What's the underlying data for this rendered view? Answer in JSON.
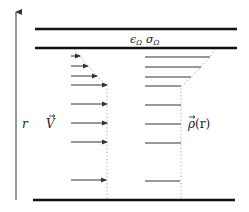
{
  "diagram": {
    "labels": {
      "layer": "ϵΩ σΩ",
      "layer_eps": "ϵ",
      "layer_sigma": "σ",
      "layer_sub": "Ω",
      "axis": "r",
      "velocity": "V",
      "density": "ρ(r)",
      "density_symbol": "ρ",
      "density_arg": "(r)"
    },
    "colors": {
      "plate": "#111111",
      "arrow": "#333333",
      "dotted": "#888888",
      "text": "#222222"
    },
    "axis": {
      "x": 16,
      "y_bottom": 200,
      "y_top": 10
    },
    "plates": [
      {
        "name": "top-outer",
        "y": 29,
        "x1": 35,
        "x2": 237
      },
      {
        "name": "top-inner",
        "y": 48,
        "x1": 35,
        "x2": 237
      },
      {
        "name": "bottom",
        "y": 200,
        "x1": 33,
        "x2": 235
      }
    ],
    "velocity_arrows": {
      "x_start": 71,
      "rows": [
        {
          "y": 56,
          "x_end": 80
        },
        {
          "y": 66,
          "x_end": 88
        },
        {
          "y": 76,
          "x_end": 97
        },
        {
          "y": 85,
          "x_end": 107
        },
        {
          "y": 104,
          "x_end": 107
        },
        {
          "y": 123,
          "x_end": 107
        },
        {
          "y": 142,
          "x_end": 107
        },
        {
          "y": 180,
          "x_end": 106
        }
      ]
    },
    "density_lines": {
      "x_start": 145,
      "rows": [
        {
          "y": 57,
          "x_end": 210
        },
        {
          "y": 67,
          "x_end": 201
        },
        {
          "y": 77,
          "x_end": 191
        },
        {
          "y": 86,
          "x_end": 181
        },
        {
          "y": 105,
          "x_end": 181
        },
        {
          "y": 124,
          "x_end": 181
        },
        {
          "y": 143,
          "x_end": 181
        },
        {
          "y": 181,
          "x_end": 180
        }
      ]
    },
    "velocity_profile_points": [
      [
        74,
        49
      ],
      [
        80,
        56
      ],
      [
        88,
        66
      ],
      [
        97,
        76
      ],
      [
        107,
        86
      ],
      [
        107,
        200
      ]
    ],
    "density_profile_points": [
      [
        215,
        49
      ],
      [
        210,
        57
      ],
      [
        201,
        67
      ],
      [
        191,
        77
      ],
      [
        181,
        87
      ],
      [
        181,
        200
      ]
    ]
  }
}
